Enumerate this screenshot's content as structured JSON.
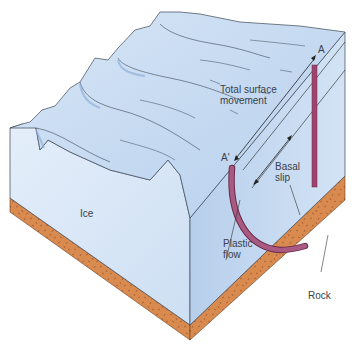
{
  "diagram": {
    "labels": {
      "ice": "Ice",
      "rock": "Rock",
      "total_surface_movement_line1": "Total surface",
      "total_surface_movement_line2": "movement",
      "basal_slip_line1": "Basal",
      "basal_slip_line2": "slip",
      "plastic_flow_line1": "Plastic",
      "plastic_flow_line2": "flow",
      "point_a": "A",
      "point_a_prime": "A'"
    },
    "colors": {
      "ice_top": "#cfe0f3",
      "ice_side_left": "#d9e7f6",
      "ice_side_right": "#c2d6ef",
      "rock": "#d98a4f",
      "rock_dark": "#b9652e",
      "marker_rod": "#a0446e",
      "outline": "#3b4656",
      "text": "#3a3f4a"
    }
  }
}
